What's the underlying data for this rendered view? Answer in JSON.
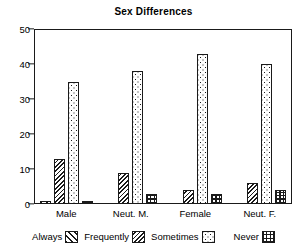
{
  "chart_data": {
    "type": "bar",
    "title": "Sex Differences",
    "xlabel": "",
    "ylabel": "",
    "ylim": [
      0,
      50
    ],
    "yticks": [
      0,
      10,
      20,
      30,
      40,
      50
    ],
    "grid": false,
    "legend_position": "bottom",
    "categories": [
      "Male",
      "Neut. M.",
      "Female",
      "Neut. F."
    ],
    "series": [
      {
        "name": "Always",
        "pattern": "diagonal-hatch-sparse",
        "values": [
          1,
          0,
          0,
          0
        ]
      },
      {
        "name": "Frequently",
        "pattern": "diagonal-hatch-dense",
        "values": [
          13,
          9,
          4,
          6
        ]
      },
      {
        "name": "Sometimes",
        "pattern": "stipple-dots",
        "values": [
          35,
          38,
          43,
          40
        ]
      },
      {
        "name": "Never",
        "pattern": "cross-hatch-grid",
        "values": [
          1,
          3,
          3,
          4
        ]
      }
    ]
  },
  "legend": {
    "items": [
      {
        "label": "Always"
      },
      {
        "label": "Frequently"
      },
      {
        "label": "Sometimes"
      },
      {
        "label": "Never"
      }
    ]
  },
  "colors": {
    "ink": "#1a1a1a",
    "background": "#ffffff"
  }
}
